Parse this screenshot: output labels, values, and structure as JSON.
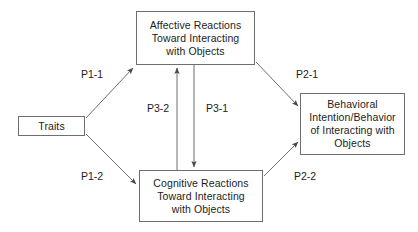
{
  "diagram": {
    "background_color": "#ffffff",
    "line_color": "#6e6e6e",
    "text_color": "#1c1c1c",
    "nodes": {
      "traits": {
        "lines": [
          "Traits"
        ]
      },
      "affective": {
        "lines": [
          "Affective Reactions",
          "Toward Interacting",
          "with Objects"
        ]
      },
      "cognitive": {
        "lines": [
          "Cognitive Reactions",
          "Toward Interacting",
          "with Objects"
        ]
      },
      "behavioral": {
        "lines": [
          "Behavioral",
          "Intention/Behavior",
          "of Interacting with",
          "Objects"
        ]
      }
    },
    "edge_labels": {
      "p1_1": "P1-1",
      "p1_2": "P1-2",
      "p2_1": "P2-1",
      "p2_2": "P2-2",
      "p3_1": "P3-1",
      "p3_2": "P3-2"
    }
  }
}
